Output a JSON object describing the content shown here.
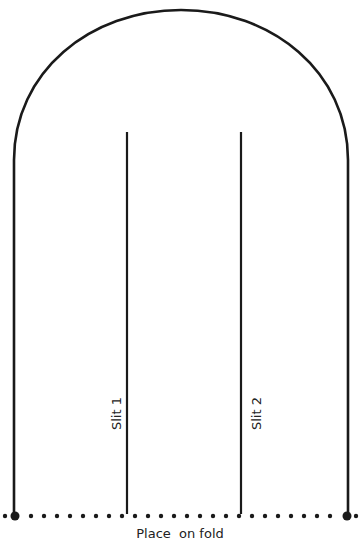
{
  "diagram": {
    "type": "sewing-pattern",
    "stroke_color": "#1a1a1a",
    "background": "#ffffff",
    "slits": [
      {
        "label": "Slit 1",
        "x": 127
      },
      {
        "label": "Slit 2",
        "x": 241
      }
    ],
    "fold_line": {
      "label": "Place  on fold",
      "style": "dotted"
    }
  }
}
